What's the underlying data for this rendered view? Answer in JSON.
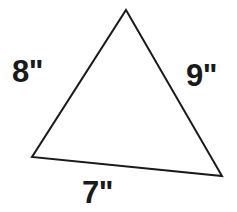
{
  "figure": {
    "type": "triangle-diagram",
    "background_color": "#ffffff",
    "stroke_color": "#1a1a1a",
    "stroke_width": 2,
    "fill_color": "#ffffff",
    "vertices": {
      "apex": {
        "x": 126,
        "y": 10
      },
      "bottom_left": {
        "x": 32,
        "y": 157
      },
      "bottom_right": {
        "x": 222,
        "y": 176
      }
    },
    "labels": {
      "left_side": "8\"",
      "right_side": "9\"",
      "bottom_side": "7\""
    },
    "label_color": "#1a1a1a"
  }
}
